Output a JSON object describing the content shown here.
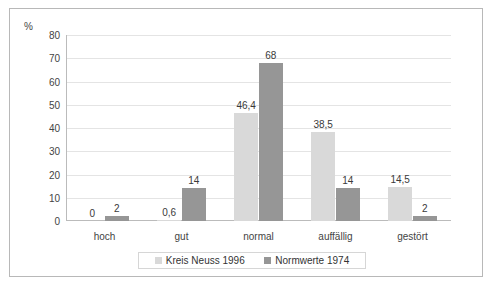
{
  "chart_data": {
    "type": "bar",
    "title": "",
    "subtitle": "",
    "xlabel": "",
    "ylabel": "%",
    "ylim": [
      0,
      80
    ],
    "ytick_step": 10,
    "yticks": [
      "80",
      "70",
      "60",
      "50",
      "40",
      "30",
      "20",
      "10",
      "0"
    ],
    "ytick_values": [
      80,
      70,
      60,
      50,
      40,
      30,
      20,
      10,
      0
    ],
    "grid": true,
    "legend_position": "bottom",
    "categories": [
      "hoch",
      "gut",
      "normal",
      "auffällig",
      "gestört"
    ],
    "series": [
      {
        "name": "Kreis Neuss 1996",
        "color": "#d9d9d9",
        "values": [
          0,
          0.6,
          46.4,
          38.5,
          14.5
        ],
        "labels": [
          "0",
          "0,6",
          "46,4",
          "38,5",
          "14,5"
        ]
      },
      {
        "name": "Normwerte 1974",
        "color": "#969696",
        "values": [
          2,
          14,
          68,
          14,
          2
        ],
        "labels": [
          "2",
          "14",
          "68",
          "14",
          "2"
        ]
      }
    ]
  },
  "legend": {
    "items": [
      {
        "label": "Kreis Neuss 1996",
        "swatch": "light"
      },
      {
        "label": "Normwerte 1974",
        "swatch": "dark"
      }
    ]
  },
  "colors": {
    "series_light": "#d9d9d9",
    "series_dark": "#969696",
    "frame": "#b8b8b8",
    "gridline": "#e4e4e4",
    "text": "#444444",
    "background": "#ffffff"
  }
}
